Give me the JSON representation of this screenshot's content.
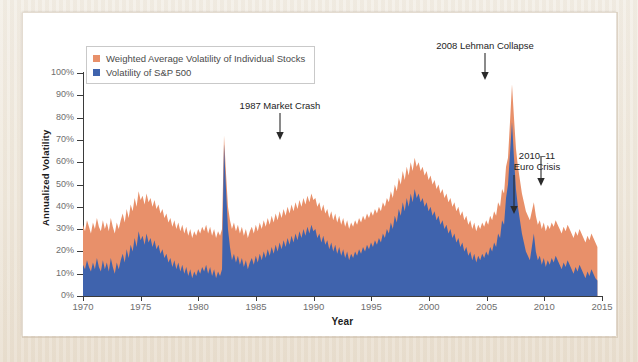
{
  "figure": {
    "background_color": "#ffffff",
    "page_color": "#efe9df"
  },
  "legend": {
    "position": "top-left",
    "items": [
      {
        "label": "Weighted Average Volatility of Individual Stocks",
        "color": "#e8906a",
        "swatch_name": "legend-swatch-individual-stocks"
      },
      {
        "label": "Volatility of S&P 500",
        "color": "#3f63ad",
        "swatch_name": "legend-swatch-sp500"
      }
    ]
  },
  "annotations": [
    {
      "label_line1": "1987 Market Crash",
      "label_line2": "",
      "x_year": 1987.8,
      "arrow": "down"
    },
    {
      "label_line1": "2008 Lehman Collapse",
      "label_line2": "",
      "x_year": 2008.7,
      "arrow": "down"
    },
    {
      "label_line1": "2010–11",
      "label_line2": "Euro Crisis",
      "x_year": 2010.4,
      "arrow": "down"
    },
    {
      "label_line1": "",
      "label_line2": "",
      "x_year": 2011.7,
      "arrow": "down"
    }
  ],
  "chart_data": {
    "type": "area",
    "title": "",
    "subtitle": "",
    "xlabel": "Year",
    "ylabel": "Annualized Volatility",
    "xlim": [
      1970,
      2015
    ],
    "ylim": [
      0,
      100
    ],
    "xticks": [
      1970,
      1975,
      1980,
      1985,
      1990,
      1995,
      2000,
      2005,
      2010,
      2015
    ],
    "xtick_labels": [
      "1970",
      "1975",
      "1980",
      "1985",
      "1990",
      "1995",
      "2000",
      "2005",
      "2010",
      "2015"
    ],
    "yticks": [
      0,
      10,
      20,
      30,
      40,
      50,
      60,
      70,
      80,
      90,
      100
    ],
    "ytick_labels": [
      "0%",
      "10%",
      "20%",
      "30%",
      "40%",
      "50%",
      "60%",
      "70%",
      "80%",
      "90%",
      "100%"
    ],
    "grid": false,
    "stacked": false,
    "legend_position": "upper left",
    "series": [
      {
        "name": "Weighted Average Volatility of Individual Stocks",
        "color": "#e8906a",
        "values": [
          32,
          29,
          34,
          31,
          28,
          33,
          30,
          35,
          31,
          29,
          34,
          30,
          33,
          29,
          35,
          31,
          28,
          33,
          30,
          34,
          37,
          33,
          39,
          35,
          41,
          38,
          44,
          40,
          47,
          43,
          45,
          41,
          46,
          42,
          44,
          40,
          43,
          39,
          41,
          37,
          39,
          35,
          37,
          33,
          35,
          31,
          34,
          30,
          33,
          29,
          32,
          28,
          31,
          27,
          30,
          26,
          29,
          27,
          30,
          28,
          31,
          29,
          32,
          28,
          31,
          27,
          30,
          26,
          29,
          27,
          30,
          72,
          55,
          40,
          34,
          30,
          33,
          29,
          32,
          28,
          31,
          27,
          30,
          26,
          29,
          31,
          28,
          32,
          29,
          33,
          30,
          34,
          31,
          35,
          32,
          36,
          33,
          37,
          34,
          38,
          35,
          39,
          36,
          40,
          37,
          41,
          38,
          42,
          39,
          43,
          40,
          44,
          41,
          45,
          42,
          46,
          43,
          44,
          40,
          42,
          38,
          41,
          37,
          39,
          35,
          38,
          34,
          37,
          33,
          36,
          32,
          35,
          31,
          34,
          30,
          33,
          31,
          34,
          32,
          35,
          33,
          36,
          34,
          37,
          35,
          38,
          36,
          39,
          37,
          40,
          38,
          42,
          40,
          44,
          42,
          47,
          44,
          50,
          47,
          53,
          50,
          56,
          52,
          58,
          54,
          60,
          56,
          62,
          58,
          60,
          56,
          58,
          54,
          56,
          52,
          54,
          50,
          52,
          48,
          50,
          46,
          48,
          44,
          46,
          42,
          44,
          40,
          42,
          38,
          40,
          36,
          38,
          34,
          36,
          32,
          34,
          30,
          33,
          29,
          32,
          30,
          33,
          31,
          34,
          32,
          36,
          34,
          38,
          36,
          42,
          40,
          48,
          46,
          58,
          62,
          78,
          95,
          80,
          66,
          58,
          52,
          46,
          42,
          38,
          36,
          34,
          38,
          42,
          36,
          32,
          34,
          30,
          33,
          29,
          32,
          30,
          33,
          31,
          34,
          32,
          30,
          28,
          31,
          29,
          32,
          30,
          28,
          26,
          29,
          27,
          30,
          28,
          26,
          24,
          27,
          25,
          28,
          26,
          24,
          22
        ]
      },
      {
        "name": "Volatility of S&P 500",
        "color": "#3f63ad",
        "values": [
          14,
          12,
          16,
          13,
          11,
          15,
          12,
          17,
          13,
          11,
          16,
          12,
          15,
          11,
          17,
          13,
          10,
          15,
          12,
          16,
          19,
          15,
          21,
          17,
          23,
          20,
          26,
          22,
          29,
          25,
          27,
          23,
          28,
          24,
          26,
          22,
          25,
          21,
          23,
          19,
          21,
          17,
          19,
          15,
          17,
          13,
          16,
          12,
          15,
          11,
          14,
          10,
          13,
          9,
          12,
          8,
          11,
          9,
          12,
          10,
          13,
          11,
          14,
          10,
          13,
          9,
          12,
          8,
          11,
          9,
          12,
          68,
          48,
          30,
          22,
          16,
          19,
          15,
          18,
          14,
          17,
          13,
          16,
          12,
          15,
          17,
          14,
          18,
          15,
          19,
          16,
          20,
          17,
          21,
          18,
          22,
          19,
          23,
          20,
          24,
          21,
          25,
          22,
          26,
          23,
          27,
          24,
          28,
          25,
          29,
          26,
          30,
          27,
          31,
          28,
          32,
          29,
          30,
          26,
          28,
          24,
          27,
          23,
          25,
          21,
          24,
          20,
          23,
          19,
          22,
          18,
          21,
          17,
          20,
          16,
          19,
          17,
          20,
          18,
          21,
          19,
          22,
          20,
          23,
          21,
          24,
          22,
          25,
          23,
          26,
          24,
          28,
          26,
          30,
          28,
          33,
          30,
          36,
          33,
          39,
          36,
          42,
          38,
          44,
          40,
          46,
          42,
          48,
          44,
          46,
          42,
          44,
          40,
          42,
          38,
          40,
          36,
          38,
          34,
          36,
          32,
          34,
          30,
          32,
          28,
          30,
          26,
          28,
          24,
          26,
          22,
          24,
          20,
          22,
          18,
          20,
          16,
          19,
          15,
          18,
          16,
          19,
          17,
          20,
          18,
          22,
          20,
          24,
          22,
          28,
          26,
          34,
          32,
          44,
          50,
          64,
          78,
          62,
          48,
          40,
          34,
          28,
          24,
          20,
          18,
          16,
          22,
          28,
          20,
          16,
          18,
          14,
          17,
          13,
          16,
          14,
          17,
          15,
          18,
          16,
          14,
          12,
          15,
          13,
          16,
          14,
          12,
          10,
          13,
          11,
          14,
          12,
          10,
          8,
          11,
          9,
          12,
          10,
          8,
          7
        ]
      }
    ]
  }
}
